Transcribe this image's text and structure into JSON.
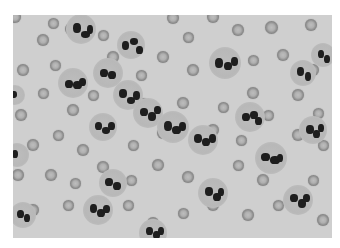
{
  "image": {
    "subject": "blood-smear-micrograph",
    "colors": {
      "background": "#cfcfcf",
      "rbc": "#8a8a8a",
      "nucleus": "#1e1e1e",
      "border": "#ffffff"
    },
    "rbcs": [
      [
        2,
        2,
        12
      ],
      [
        30,
        25,
        12
      ],
      [
        40,
        8,
        11
      ],
      [
        58,
        14,
        12
      ],
      [
        90,
        20,
        11
      ],
      [
        120,
        24,
        11
      ],
      [
        160,
        3,
        12
      ],
      [
        175,
        22,
        11
      ],
      [
        200,
        2,
        12
      ],
      [
        225,
        15,
        12
      ],
      [
        258,
        12,
        13
      ],
      [
        298,
        10,
        12
      ],
      [
        10,
        55,
        12
      ],
      [
        42,
        50,
        11
      ],
      [
        55,
        70,
        12
      ],
      [
        30,
        78,
        11
      ],
      [
        100,
        42,
        12
      ],
      [
        128,
        60,
        11
      ],
      [
        150,
        42,
        12
      ],
      [
        180,
        55,
        12
      ],
      [
        208,
        48,
        12
      ],
      [
        240,
        45,
        11
      ],
      [
        270,
        40,
        12
      ],
      [
        300,
        55,
        12
      ],
      [
        8,
        100,
        12
      ],
      [
        60,
        95,
        12
      ],
      [
        80,
        80,
        11
      ],
      [
        130,
        88,
        11
      ],
      [
        170,
        88,
        12
      ],
      [
        210,
        92,
        11
      ],
      [
        240,
        78,
        12
      ],
      [
        255,
        100,
        11
      ],
      [
        285,
        80,
        12
      ],
      [
        305,
        98,
        11
      ],
      [
        20,
        130,
        12
      ],
      [
        45,
        120,
        11
      ],
      [
        70,
        135,
        12
      ],
      [
        120,
        130,
        11
      ],
      [
        150,
        118,
        12
      ],
      [
        200,
        115,
        12
      ],
      [
        228,
        125,
        11
      ],
      [
        285,
        120,
        12
      ],
      [
        310,
        130,
        11
      ],
      [
        5,
        160,
        12
      ],
      [
        38,
        160,
        12
      ],
      [
        62,
        168,
        11
      ],
      [
        90,
        152,
        12
      ],
      [
        118,
        165,
        11
      ],
      [
        145,
        150,
        12
      ],
      [
        175,
        162,
        12
      ],
      [
        225,
        150,
        11
      ],
      [
        250,
        165,
        12
      ],
      [
        300,
        165,
        11
      ],
      [
        20,
        195,
        12
      ],
      [
        55,
        190,
        11
      ],
      [
        85,
        200,
        12
      ],
      [
        115,
        190,
        11
      ],
      [
        140,
        208,
        12
      ],
      [
        170,
        198,
        11
      ],
      [
        200,
        190,
        12
      ],
      [
        235,
        200,
        12
      ],
      [
        265,
        190,
        11
      ],
      [
        310,
        205,
        12
      ]
    ],
    "wbcs": [
      {
        "x": 68,
        "y": 14,
        "r": 15,
        "lobes": [
          [
            -8,
            -6,
            8,
            10
          ],
          [
            0,
            2,
            9,
            7
          ],
          [
            6,
            -4,
            6,
            9
          ]
        ]
      },
      {
        "x": 118,
        "y": 30,
        "r": 14,
        "lobes": [
          [
            -9,
            -4,
            7,
            9
          ],
          [
            -1,
            -7,
            8,
            7
          ],
          [
            5,
            1,
            7,
            8
          ]
        ]
      },
      {
        "x": 212,
        "y": 48,
        "r": 16,
        "lobes": [
          [
            -10,
            -5,
            8,
            10
          ],
          [
            -1,
            -1,
            8,
            8
          ],
          [
            6,
            -6,
            7,
            9
          ]
        ]
      },
      {
        "x": 60,
        "y": 68,
        "r": 15,
        "lobes": [
          [
            -8,
            -3,
            8,
            8
          ],
          [
            0,
            -2,
            9,
            8
          ],
          [
            6,
            -5,
            7,
            8
          ]
        ]
      },
      {
        "x": 115,
        "y": 80,
        "r": 15,
        "lobes": [
          [
            -9,
            -6,
            8,
            9
          ],
          [
            -1,
            2,
            8,
            7
          ],
          [
            5,
            -4,
            7,
            9
          ]
        ]
      },
      {
        "x": 135,
        "y": 98,
        "r": 15,
        "lobes": [
          [
            -8,
            -5,
            8,
            8
          ],
          [
            0,
            -1,
            8,
            9
          ],
          [
            6,
            -7,
            7,
            8
          ]
        ]
      },
      {
        "x": 160,
        "y": 112,
        "r": 16,
        "lobes": [
          [
            -9,
            -6,
            8,
            10
          ],
          [
            -1,
            -1,
            9,
            8
          ],
          [
            6,
            -5,
            7,
            9
          ]
        ]
      },
      {
        "x": 237,
        "y": 102,
        "r": 15,
        "lobes": [
          [
            -8,
            -4,
            8,
            8
          ],
          [
            0,
            -6,
            8,
            8
          ],
          [
            5,
            0,
            7,
            8
          ]
        ]
      },
      {
        "x": 90,
        "y": 112,
        "r": 14,
        "lobes": [
          [
            -8,
            -5,
            7,
            8
          ],
          [
            -1,
            0,
            8,
            7
          ],
          [
            5,
            -5,
            7,
            8
          ]
        ]
      },
      {
        "x": 190,
        "y": 125,
        "r": 15,
        "lobes": [
          [
            -9,
            -6,
            8,
            9
          ],
          [
            -1,
            -2,
            8,
            8
          ],
          [
            6,
            -6,
            7,
            9
          ]
        ]
      },
      {
        "x": 258,
        "y": 143,
        "r": 16,
        "lobes": [
          [
            -10,
            -5,
            9,
            8
          ],
          [
            -1,
            -2,
            10,
            8
          ],
          [
            6,
            -4,
            6,
            8
          ]
        ]
      },
      {
        "x": 300,
        "y": 115,
        "r": 14,
        "lobes": [
          [
            -7,
            -5,
            8,
            9
          ],
          [
            0,
            0,
            7,
            8
          ],
          [
            5,
            -6,
            6,
            8
          ]
        ]
      },
      {
        "x": 95,
        "y": 58,
        "r": 15,
        "lobes": [
          [
            -8,
            -4,
            8,
            8
          ],
          [
            0,
            -2,
            8,
            8
          ]
        ]
      },
      {
        "x": 290,
        "y": 58,
        "r": 13,
        "lobes": [
          [
            -6,
            -6,
            7,
            9
          ],
          [
            2,
            -1,
            6,
            9
          ]
        ]
      },
      {
        "x": 200,
        "y": 178,
        "r": 15,
        "lobes": [
          [
            -8,
            -6,
            8,
            9
          ],
          [
            0,
            0,
            8,
            8
          ],
          [
            5,
            -5,
            6,
            8
          ]
        ]
      },
      {
        "x": 85,
        "y": 195,
        "r": 15,
        "lobes": [
          [
            -8,
            -6,
            7,
            9
          ],
          [
            -1,
            -1,
            8,
            8
          ],
          [
            5,
            -5,
            7,
            8
          ]
        ]
      },
      {
        "x": 100,
        "y": 168,
        "r": 14,
        "lobes": [
          [
            -8,
            -5,
            8,
            8
          ],
          [
            0,
            -1,
            8,
            8
          ]
        ]
      },
      {
        "x": 285,
        "y": 185,
        "r": 15,
        "lobes": [
          [
            -8,
            -6,
            8,
            8
          ],
          [
            0,
            -1,
            8,
            9
          ],
          [
            5,
            -6,
            7,
            8
          ]
        ]
      },
      {
        "x": 10,
        "y": 200,
        "r": 13,
        "lobes": [
          [
            -6,
            -5,
            7,
            8
          ],
          [
            1,
            -1,
            6,
            8
          ]
        ]
      },
      {
        "x": 140,
        "y": 218,
        "r": 14,
        "lobes": [
          [
            -7,
            -6,
            7,
            8
          ],
          [
            0,
            -2,
            7,
            8
          ],
          [
            5,
            -6,
            6,
            8
          ]
        ]
      },
      {
        "x": 4,
        "y": 140,
        "r": 12,
        "lobes": [
          [
            -5,
            -5,
            6,
            8
          ]
        ]
      },
      {
        "x": 310,
        "y": 40,
        "r": 12,
        "lobes": [
          [
            -5,
            -5,
            6,
            8
          ],
          [
            1,
            0,
            6,
            8
          ]
        ]
      },
      {
        "x": 2,
        "y": 80,
        "r": 10,
        "lobes": [
          [
            -4,
            -4,
            6,
            7
          ]
        ]
      }
    ]
  }
}
